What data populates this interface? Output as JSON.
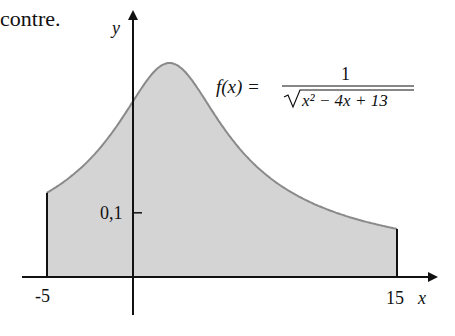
{
  "caption": "contre.",
  "chart_data": {
    "type": "area",
    "title": "",
    "function_label": "f(x) = 1 / sqrt(x^2 - 4x + 13)",
    "formula": {
      "lhs": "f(x) =",
      "numerator": "1",
      "denominator": "x² − 4x + 13"
    },
    "xlabel": "x",
    "ylabel": "y",
    "x_ticks": [
      {
        "value": -5,
        "label": "-5"
      },
      {
        "value": 15,
        "label": "15"
      }
    ],
    "y_ticks": [
      {
        "value": 0.1,
        "label": "0,1"
      }
    ],
    "shaded_interval": [
      -5,
      15
    ],
    "xlim": [
      -6.4,
      17.4
    ],
    "ylim": [
      0,
      0.41
    ],
    "grid": false,
    "legend": null,
    "x": [
      -5,
      -4,
      -3,
      -2,
      -1,
      0,
      1,
      2,
      3,
      4,
      5,
      6,
      7,
      8,
      9,
      10,
      11,
      12,
      13,
      14,
      15
    ],
    "values": [
      0.131,
      0.158,
      0.192,
      0.236,
      0.285,
      0.277,
      0.316,
      0.333,
      0.316,
      0.277,
      0.236,
      0.2,
      0.171,
      0.149,
      0.131,
      0.117,
      0.105,
      0.096,
      0.088,
      0.081,
      0.075
    ],
    "fill_color": "#d4d4d4",
    "curve_color": "#8a8a8a",
    "axis_color": "#111111"
  }
}
